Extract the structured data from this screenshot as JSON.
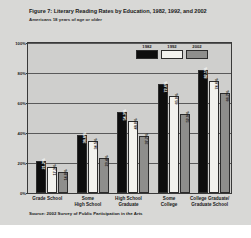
{
  "figure": {
    "title": "Figure 7: Literary Reading Rates by Education, 1982, 1992, and 2002",
    "subtitle": "Americans 18 years of age or older",
    "source": "Source: 2002 Survey of Public Participation in the Arts"
  },
  "colors": {
    "series_1982": "#0d0d0d",
    "series_1992": "#f2f2ee",
    "series_2002": "#8e8e8c",
    "panel_background": "#cfcfcd",
    "figure_background": "#d8d8d6",
    "axis": "#3a3a3a"
  },
  "chart_data": {
    "type": "bar",
    "title": "Figure 7: Literary Reading Rates by Education, 1982, 1992, and 2002",
    "subtitle": "Americans 18 years of age or older",
    "xlabel": "",
    "ylabel": "",
    "ylim": [
      0,
      100
    ],
    "yticks": [
      "0%",
      "20%",
      "40%",
      "60%",
      "80%",
      "100%"
    ],
    "ytick_values": [
      0,
      20,
      40,
      60,
      80,
      100
    ],
    "grid": true,
    "legend_position": "top-center",
    "categories": [
      "Grade School",
      "Some High School",
      "High School Graduate",
      "Some College",
      "College Graduate/ Graduate School"
    ],
    "category_lines": [
      [
        "Grade School"
      ],
      [
        "Some",
        "High School"
      ],
      [
        "High School",
        "Graduate"
      ],
      [
        "Some",
        "College"
      ],
      [
        "College Graduate/",
        "Graduate School"
      ]
    ],
    "series": [
      {
        "name": "1982",
        "color": "#0d0d0d",
        "values": [
          21.2,
          38.8,
          54.3,
          72.6,
          82.1
        ],
        "labels": [
          "21.2%",
          "38.8%",
          "54.3%",
          "72.6%",
          "82.1%"
        ]
      },
      {
        "name": "1992",
        "color": "#f2f2ee",
        "values": [
          17.3,
          34.5,
          48.0,
          65.0,
          74.6
        ],
        "labels": [
          "17.3%",
          "34.5%",
          "48.0%",
          "65.0%",
          "74.6%"
        ]
      },
      {
        "name": "2002",
        "color": "#8e8e8c",
        "values": [
          14.0,
          23.4,
          37.7,
          52.9,
          66.7
        ],
        "labels": [
          "14.0%",
          "23.4%",
          "37.7%",
          "52.9%",
          "66.7%"
        ]
      }
    ]
  }
}
